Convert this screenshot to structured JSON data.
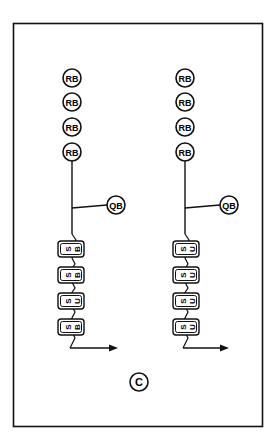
{
  "diagram": {
    "panel_label": "C",
    "colors": {
      "stroke": "#111111",
      "background": "#ffffff"
    },
    "columns": [
      {
        "id": "left",
        "rb_labels": [
          "RB",
          "RB",
          "RB",
          "RB"
        ],
        "qb_label": "QB",
        "units": [
          {
            "a": "S",
            "b": "B"
          },
          {
            "a": "S",
            "b": "B"
          },
          {
            "a": "S",
            "b": "U"
          },
          {
            "a": "S",
            "b": "B"
          }
        ]
      },
      {
        "id": "right",
        "rb_labels": [
          "RB",
          "RB",
          "RB",
          "RB"
        ],
        "qb_label": "QB",
        "units": [
          {
            "a": "S",
            "b": "U"
          },
          {
            "a": "S",
            "b": "U"
          },
          {
            "a": "S",
            "b": "U"
          },
          {
            "a": "S",
            "b": "U"
          }
        ]
      }
    ]
  }
}
